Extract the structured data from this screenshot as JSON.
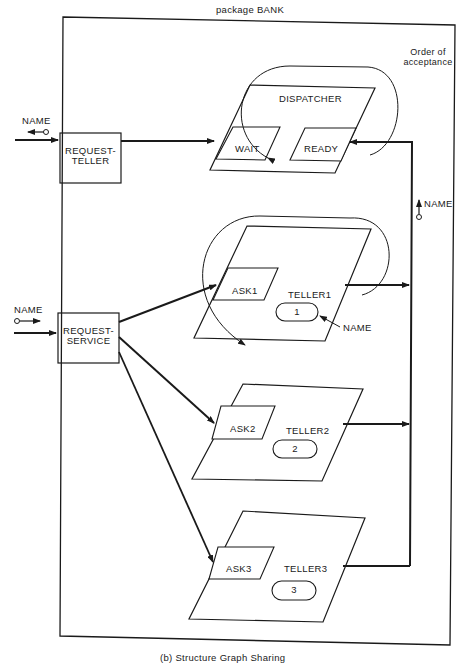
{
  "title": "package BANK",
  "caption": "(b) Structure Graph Sharing",
  "annotation_order": "Order of\nacceptance",
  "annotation_order_line1": "Order of",
  "annotation_order_line2": "acceptance",
  "external_params": {
    "request_teller_param": "NAME",
    "request_service_param": "NAME",
    "teller_output_param": "NAME",
    "teller_name_label": "NAME"
  },
  "entries": {
    "request_teller": {
      "line1": "REQUEST-",
      "line2": "TELLER"
    },
    "request_service": {
      "line1": "REQUEST-",
      "line2": "SERVICE"
    }
  },
  "dispatcher": {
    "label": "DISPATCHER",
    "entries": [
      "WAIT",
      "READY"
    ]
  },
  "tellers": [
    {
      "label": "TELLER1",
      "entry": "ASK1",
      "name_value": "1"
    },
    {
      "label": "TELLER2",
      "entry": "ASK2",
      "name_value": "2"
    },
    {
      "label": "TELLER3",
      "entry": "ASK3",
      "name_value": "3"
    }
  ],
  "colors": {
    "ink": "#1a1a1a",
    "paper": "#ffffff"
  }
}
